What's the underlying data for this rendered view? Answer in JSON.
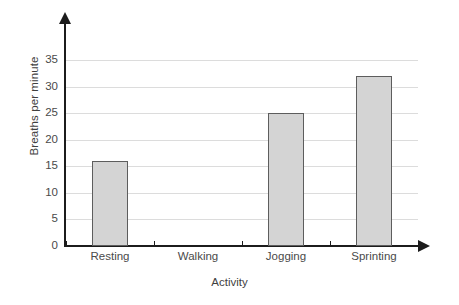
{
  "chart_data": {
    "type": "bar",
    "title": "",
    "xlabel": "Activity",
    "ylabel": "Breaths per minute",
    "categories": [
      "Resting",
      "Walking",
      "Jogging",
      "Sprinting"
    ],
    "values": [
      16,
      null,
      25,
      32
    ],
    "value_labels": [
      "16",
      "",
      "25",
      "32"
    ],
    "ylim": [
      0,
      35
    ],
    "ytick_labels": [
      "0",
      "5",
      "10",
      "15",
      "20",
      "25",
      "30",
      "35"
    ],
    "ytick_values": [
      0,
      5,
      10,
      15,
      20,
      25,
      30,
      35
    ],
    "grid": true,
    "grid_axis": "y",
    "legend": "none",
    "colors": {
      "bar_fill": "#d4d4d4",
      "bar_edge": "#5d5d5d",
      "gridline": "#dcdcdc",
      "axis": "#1c1c1c",
      "background": "#ffffff",
      "text": "#4a4a4a"
    }
  }
}
